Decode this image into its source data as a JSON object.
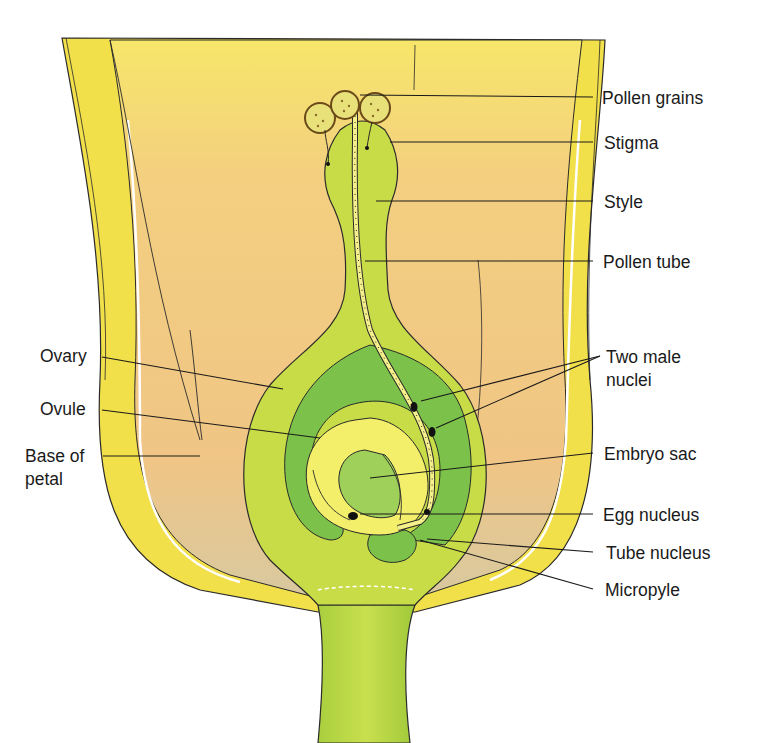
{
  "diagram": {
    "labels": {
      "pollen_grains": "Pollen grains",
      "stigma": "Stigma",
      "style": "Style",
      "pollen_tube": "Pollen tube",
      "two_male_nuclei_1": "Two male",
      "two_male_nuclei_2": "nuclei",
      "embryo_sac": "Embryo sac",
      "egg_nucleus": "Egg nucleus",
      "tube_nucleus": "Tube nucleus",
      "micropyle": "Micropyle",
      "ovary": "Ovary",
      "ovule": "Ovule",
      "base_of_petal_1": "Base of",
      "base_of_petal_2": "petal"
    },
    "colors": {
      "petal_outer": "#f2e04a",
      "petal_inner": "#f5d98a",
      "petal_orange": "#efb86a",
      "carpel_light_green": "#c5dc4a",
      "ovary_dark_green": "#7cc24a",
      "ovule_yellow": "#f3ef6a",
      "embryo_sac_green": "#9fd05a",
      "outline": "#2a2a2a"
    }
  }
}
